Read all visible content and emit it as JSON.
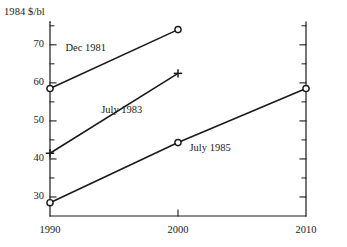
{
  "chart_data": {
    "type": "line",
    "title": "",
    "subtitle": "",
    "ylabel": "1984 $/bl",
    "xlabel": "",
    "x": [
      1990,
      2000,
      2010
    ],
    "xlim": [
      1990,
      2010
    ],
    "ylim": [
      25,
      76
    ],
    "grid": false,
    "legend_position": "inline-annotations",
    "x_tick_labels": [
      "1990",
      "2000",
      "2010"
    ],
    "y_tick_labels": [
      "30",
      "40",
      "50",
      "60",
      "70"
    ],
    "y_major_ticks": [
      30,
      40,
      50,
      60,
      70
    ],
    "y_minor_ticks": [
      35,
      45,
      55,
      65,
      75
    ],
    "series": [
      {
        "name": "Dec 1981",
        "marker": "open-circle",
        "x": [
          1990,
          2000
        ],
        "values": [
          58.5,
          74.0
        ],
        "label_x": 1991.2,
        "label_y": 69.0
      },
      {
        "name": "July 1983",
        "marker": "plus",
        "x": [
          1990,
          2000
        ],
        "values": [
          41.5,
          62.5
        ],
        "label_x": 1994.0,
        "label_y": 52.5
      },
      {
        "name": "July 1985",
        "marker": "open-circle",
        "x": [
          1990,
          2000,
          2010
        ],
        "values": [
          28.5,
          44.3,
          58.5
        ],
        "label_x": 2000.9,
        "label_y": 42.6
      }
    ],
    "colors": {
      "line": "#1a1a1a",
      "axis": "#1a1a1a",
      "text": "#1a1a1a",
      "background": "#ffffff"
    }
  }
}
